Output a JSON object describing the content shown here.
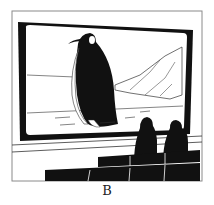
{
  "figure": {
    "caption": "B",
    "colors": {
      "ink": "#111111",
      "paper": "#ffffff",
      "frame": "#8a8a8a"
    }
  }
}
